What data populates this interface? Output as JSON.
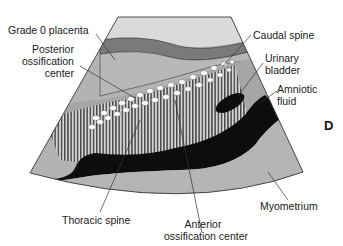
{
  "figure": {
    "panel_letter": "D",
    "labels": {
      "grade0_placenta": "Grade 0 placenta",
      "posterior_ossification": [
        "Posterior",
        "ossification",
        "center"
      ],
      "caudal_spine": "Caudal spine",
      "urinary_bladder": [
        "Urinary",
        "bladder"
      ],
      "amniotic_fluid": [
        "Amniotic",
        "fluid"
      ],
      "thoracic_spine": "Thoracic spine",
      "anterior_ossification": [
        "Anterior",
        "ossification center"
      ],
      "myometrium": "Myometrium"
    },
    "colors": {
      "background": "#ffffff",
      "near_field": "#d9d9d9",
      "placenta_band": "#7a7a7a",
      "uterine_tissue": "#b5b5b5",
      "fetal_body": "#a8a8a8",
      "fluid_black": "#0d0d0d",
      "ossification_white": "#ffffff",
      "outline": "#3a3a3a"
    }
  }
}
